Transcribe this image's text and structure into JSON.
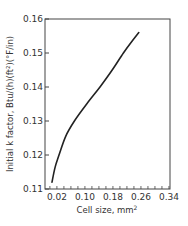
{
  "chart_data": {
    "type": "line",
    "title": "",
    "xlabel": "Cell size, mm²",
    "ylabel": "Initial k factor, Btu/(h)(ft²)(°F/in)",
    "xlim": [
      -0.014,
      0.343
    ],
    "ylim": [
      0.11,
      0.16
    ],
    "xticks": [
      0.02,
      0.1,
      0.18,
      0.26,
      0.34
    ],
    "xtick_labels": [
      "0.02",
      "0.10",
      "0.18",
      "0.26",
      "0.34"
    ],
    "yticks": [
      0.11,
      0.12,
      0.13,
      0.14,
      0.15,
      0.16
    ],
    "ytick_labels": [
      "0.11",
      "0.12",
      "0.13",
      "0.14",
      "0.15",
      "0.16"
    ],
    "grid": false,
    "legend": null,
    "series": [
      {
        "name": "Initial k factor",
        "x": [
          0.006,
          0.015,
          0.026,
          0.045,
          0.07,
          0.105,
          0.143,
          0.178,
          0.21,
          0.235,
          0.254
        ],
        "y": [
          0.112,
          0.1165,
          0.12,
          0.1255,
          0.13,
          0.135,
          0.14,
          0.145,
          0.15,
          0.1535,
          0.156
        ]
      }
    ]
  },
  "labels": {
    "xlabel_main": "Cell size, mm",
    "xlabel_sup": "2",
    "ylabel": "Initial k factor, Btu/(h)(ft²)(°F/in)"
  }
}
